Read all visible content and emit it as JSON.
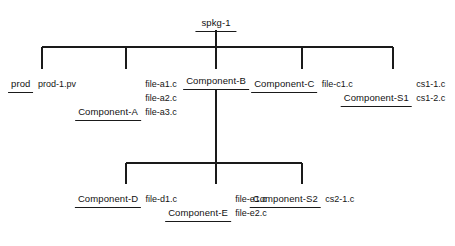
{
  "diagram": {
    "type": "hierarchy-tree",
    "line_color": "#1a1a1a",
    "background_color": "#ffffff",
    "text_color": "#111111",
    "root": {
      "label": "spkg-1",
      "files": []
    },
    "level1": [
      {
        "label": "prod",
        "files": [
          "prod-1.pv"
        ]
      },
      {
        "label": "Component-A",
        "files": [
          "file-a1.c",
          "file-a2.c",
          "file-a3.c"
        ]
      },
      {
        "label": "Component-B",
        "files": []
      },
      {
        "label": "Component-C",
        "files": [
          "file-c1.c"
        ]
      },
      {
        "label": "Component-S1",
        "files": [
          "cs1-1.c",
          "cs1-2.c"
        ]
      }
    ],
    "level2_parent": "Component-B",
    "level2": [
      {
        "label": "Component-D",
        "files": [
          "file-d1.c"
        ]
      },
      {
        "label": "Component-E",
        "files": [
          "file-e1.c",
          "file-e2.c"
        ]
      },
      {
        "label": "Component-S2",
        "files": [
          "cs2-1.c"
        ]
      }
    ]
  }
}
